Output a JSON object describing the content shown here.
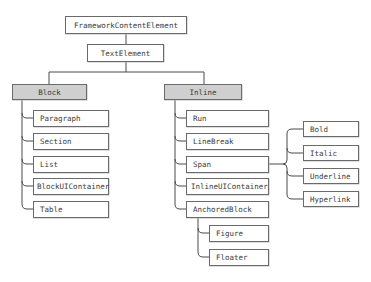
{
  "diagram": {
    "root": "FrameworkContentElement",
    "level1": "TextElement",
    "block": {
      "label": "Block",
      "children": [
        "Paragraph",
        "Section",
        "List",
        "BlockUIContainer",
        "Table"
      ]
    },
    "inline": {
      "label": "Inline",
      "children": [
        "Run",
        "LineBreak",
        "Span",
        "InlineUIContainer",
        "AnchoredBlock"
      ],
      "anchored_children": [
        "Figure",
        "Floater"
      ],
      "span_children": [
        "Bold",
        "Italic",
        "Underline",
        "Hyperlink"
      ]
    },
    "colors": {
      "category_fill": "#cfcfcf",
      "node_fill": "#ffffff",
      "border": "#6a6a6a",
      "line": "#4a4a4a"
    }
  }
}
